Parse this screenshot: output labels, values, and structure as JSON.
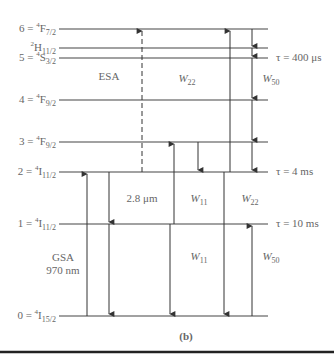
{
  "figure": {
    "panel_label": "(b)",
    "levels": [
      {
        "id": "6",
        "label_main": "6 = ",
        "sup": "4",
        "term": "F",
        "sub": "7/2"
      },
      {
        "id": "2H",
        "label_main": "",
        "sup": "2",
        "term": "H",
        "sub": "11/2"
      },
      {
        "id": "5",
        "label_main": "5 = ",
        "sup": "4",
        "term": "S",
        "sub": "3/2"
      },
      {
        "id": "4",
        "label_main": "4 = ",
        "sup": "4",
        "term": "F",
        "sub": "9/2"
      },
      {
        "id": "3",
        "label_main": "3 = ",
        "sup": "4",
        "term": "F",
        "sub": "9/2"
      },
      {
        "id": "2",
        "label_main": "2 = ",
        "sup": "4",
        "term": "I",
        "sub": "11/2"
      },
      {
        "id": "1",
        "label_main": "1 = ",
        "sup": "4",
        "term": "I",
        "sub": "11/2"
      },
      {
        "id": "0",
        "label_main": "0 = ",
        "sup": "4",
        "term": "I",
        "sub": "15/2"
      }
    ],
    "lifetimes": [
      {
        "text": "τ = 400 μs"
      },
      {
        "text": "τ = 4 ms"
      },
      {
        "text": "τ = 10 ms"
      }
    ],
    "annotations": {
      "esa": "ESA",
      "w22_upper": {
        "main": "W",
        "sub": "22"
      },
      "w50_upper": {
        "main": "W",
        "sub": "50"
      },
      "wavelength_28": "2.8 μm",
      "w11_mid": {
        "main": "W",
        "sub": "11"
      },
      "w22_mid": {
        "main": "W",
        "sub": "22"
      },
      "gsa": "GSA",
      "gsa_wavelength": "970 nm",
      "w11_low": {
        "main": "W",
        "sub": "11"
      },
      "w50_low": {
        "main": "W",
        "sub": "50"
      }
    },
    "colors": {
      "line": "#333333",
      "text": "#666666",
      "rule": "#222222"
    }
  }
}
